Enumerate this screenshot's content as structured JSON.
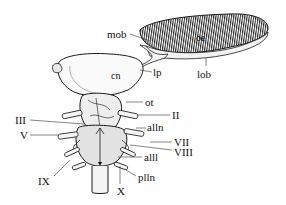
{
  "figure": {
    "ink_color": "#1a1a1a",
    "labels": {
      "mob": "mob",
      "oe": "oe",
      "cn": "cn",
      "lp": "lp",
      "lob": "lob",
      "ot": "ot",
      "II": "II",
      "III": "III",
      "alln": "alln",
      "V": "V",
      "VII": "VII",
      "VIII": "VIII",
      "alll": "alll",
      "IX": "IX",
      "plln": "plln",
      "X": "X"
    }
  }
}
